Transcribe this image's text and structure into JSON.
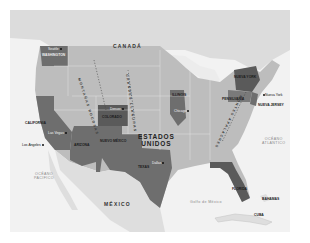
{
  "map": {
    "title": "Estados Unidos",
    "countries": {
      "canada": "CANADÁ",
      "usa_line1": "ESTADOS",
      "usa_line2": "UNIDOS",
      "mexico": "MÉXICO",
      "cuba": "CUBA",
      "bahamas": "BAHAMAS"
    },
    "water": {
      "pacific_line1": "OCÉANO",
      "pacific_line2": "PACÍFICO",
      "atlantic_line1": "OCÉANO",
      "atlantic_line2": "ATLÁNTICO",
      "gulf": "Golfo de México"
    },
    "highlighted_states": [
      {
        "name": "WASHINGTON"
      },
      {
        "name": "CALIFORNIA"
      },
      {
        "name": "ARIZONA"
      },
      {
        "name": "NUEVO MÉXICO"
      },
      {
        "name": "COLORADO"
      },
      {
        "name": "TEXAS"
      },
      {
        "name": "ILLINOIS"
      },
      {
        "name": "NUEVA YORK"
      },
      {
        "name": "PENSILVANIA"
      },
      {
        "name": "NUEVA JERSEY"
      },
      {
        "name": "FLORIDA"
      }
    ],
    "cities": [
      {
        "name": "Seattle"
      },
      {
        "name": "Los Ángeles"
      },
      {
        "name": "Las Vegas"
      },
      {
        "name": "Denver"
      },
      {
        "name": "Dallas"
      },
      {
        "name": "Chicago"
      },
      {
        "name": "Nueva York"
      },
      {
        "name": "Miami"
      }
    ],
    "ranges": {
      "rockies": "MONTAÑAS ROCOSAS",
      "plains": "GRANDES LLANURAS",
      "appalachians": "MONTES APALACHES"
    },
    "colors": {
      "background": "#f2f2f2",
      "land": "#bdbdbd",
      "highlight": "#6e6e6e",
      "highlight_dark": "#5a5a5a",
      "water": "#f0f0f0",
      "border": "#e6e6e6"
    }
  }
}
